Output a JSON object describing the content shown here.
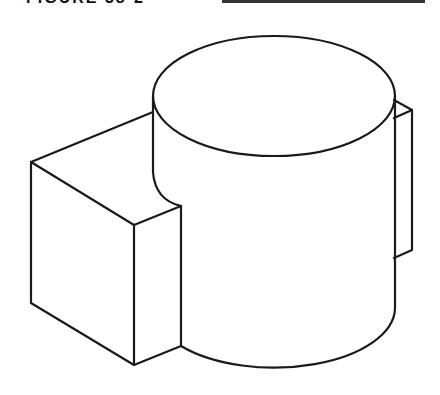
{
  "figure": {
    "caption": "FIGURE 38-2",
    "stroke_color": "#1a1a1a",
    "background": "#ffffff"
  }
}
